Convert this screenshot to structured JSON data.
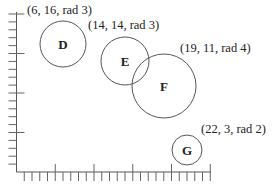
{
  "chart_data": {
    "type": "scatter",
    "title": "",
    "xlabel": "",
    "ylabel": "",
    "grid": false,
    "axis_ticks": {
      "x_unit_px": 7.75,
      "y_unit_px": 7.9,
      "major_every": 5
    },
    "xlim": [
      0,
      25
    ],
    "ylim": [
      0,
      20
    ],
    "points": [
      {
        "name": "D",
        "x": 6,
        "y": 16,
        "radius": 3,
        "label": "(6, 16, rad 3)"
      },
      {
        "name": "E",
        "x": 14,
        "y": 14,
        "radius": 3,
        "label": "(14, 14, rad 3)"
      },
      {
        "name": "F",
        "x": 19,
        "y": 11,
        "radius": 4,
        "label": "(19, 11, rad 4)"
      },
      {
        "name": "G",
        "x": 22,
        "y": 3,
        "radius": 2,
        "label": "(22, 3, rad 2)"
      }
    ]
  },
  "circles": [
    {
      "name": "D",
      "label": "(6, 16, rad 3)"
    },
    {
      "name": "E",
      "label": "(14, 14, rad 3)"
    },
    {
      "name": "F",
      "label": "(19, 11, rad 4)"
    },
    {
      "name": "G",
      "label": "(22, 3, rad 2)"
    }
  ],
  "colors": {
    "stroke": "#555555",
    "text": "#222222",
    "background": "#ffffff"
  }
}
